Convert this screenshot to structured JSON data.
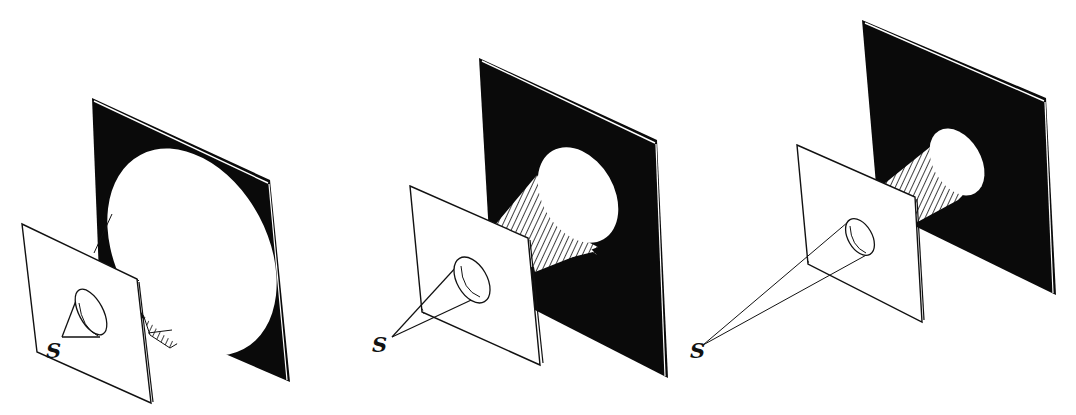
{
  "figure": {
    "colors": {
      "plate": "#0a0a0a",
      "paper": "#ffffff",
      "ink": "#111111"
    },
    "panels": [
      {
        "id": "panel-1",
        "source_label": "S",
        "source_distance": "near",
        "shadow_size": "large"
      },
      {
        "id": "panel-2",
        "source_label": "S",
        "source_distance": "medium",
        "shadow_size": "medium"
      },
      {
        "id": "panel-3",
        "source_label": "S",
        "source_distance": "far",
        "shadow_size": "small"
      }
    ]
  }
}
